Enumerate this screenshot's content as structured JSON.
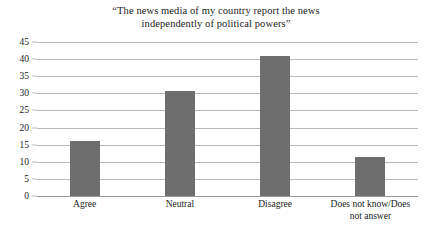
{
  "chart_data": {
    "type": "bar",
    "title": "“The news media of my country report the news independently of political powers”",
    "title_lines": [
      "“The news media of my country report the news",
      "independently of political powers”"
    ],
    "categories": [
      "Agree",
      "Neutral",
      "Disagree",
      "Does not know/Does not answer"
    ],
    "category_lines": [
      [
        "Agree"
      ],
      [
        "Neutral"
      ],
      [
        "Disagree"
      ],
      [
        "Does not know/Does",
        "not answer"
      ]
    ],
    "values": [
      16,
      30.7,
      41,
      11.3
    ],
    "xlabel": "",
    "ylabel": "",
    "ylim": [
      0,
      45
    ],
    "y_ticks": [
      0,
      5,
      10,
      15,
      20,
      25,
      30,
      35,
      40,
      45
    ],
    "y_tick_labels": [
      "0",
      "5",
      "10",
      "15",
      "20",
      "25",
      "30",
      "35",
      "40",
      "45"
    ],
    "grid": true,
    "legend": "none",
    "bar_color": "#6e6e6e",
    "grid_color": "#b9b9b9",
    "background_color": "#ffffff",
    "text_color": "#1a1a1a"
  }
}
